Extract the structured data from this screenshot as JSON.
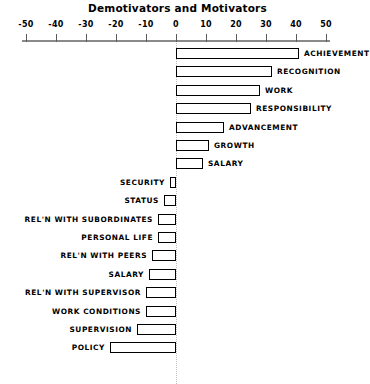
{
  "chart": {
    "title": "Demotivators and Motivators"
  },
  "axis": {
    "min": -50,
    "max": 50,
    "ticks": [
      -50,
      -40,
      -30,
      -20,
      -10,
      0,
      10,
      20,
      30,
      40,
      50
    ],
    "tick_labels": [
      "-50",
      "-40",
      "-30",
      "-20",
      "-10",
      "0",
      "10",
      "20",
      "30",
      "40",
      "50"
    ]
  },
  "chart_data": {
    "type": "bar",
    "orientation": "horizontal",
    "title": "Demotivators and Motivators",
    "xlabel": "",
    "ylabel": "",
    "xlim": [
      -50,
      50
    ],
    "grid": false,
    "legend": "none",
    "categories": [
      "ACHIEVEMENT",
      "RECOGNITION",
      "WORK",
      "RESPONSIBILITY",
      "ADVANCEMENT",
      "GROWTH",
      "SALARY",
      "SECURITY",
      "STATUS",
      "REL'N WITH SUBORDINATES",
      "PERSONAL LIFE",
      "REL'N WITH PEERS",
      "SALARY",
      "REL'N WITH SUPERVISOR",
      "WORK CONDITIONS",
      "SUPERVISION",
      "POLICY"
    ],
    "values": [
      41,
      32,
      28,
      25,
      16,
      11,
      9,
      -2,
      -4,
      -6,
      -6,
      -8,
      -9,
      -10,
      -10,
      -13,
      -22
    ]
  },
  "bars": [
    {
      "label": "ACHIEVEMENT",
      "value": 41,
      "side": "positive"
    },
    {
      "label": "RECOGNITION",
      "value": 32,
      "side": "positive"
    },
    {
      "label": "WORK",
      "value": 28,
      "side": "positive"
    },
    {
      "label": "RESPONSIBILITY",
      "value": 25,
      "side": "positive"
    },
    {
      "label": "ADVANCEMENT",
      "value": 16,
      "side": "positive"
    },
    {
      "label": "GROWTH",
      "value": 11,
      "side": "positive"
    },
    {
      "label": "SALARY",
      "value": 9,
      "side": "positive"
    },
    {
      "label": "SECURITY",
      "value": -2,
      "side": "negative"
    },
    {
      "label": "STATUS",
      "value": -4,
      "side": "negative"
    },
    {
      "label": "REL'N WITH SUBORDINATES",
      "value": -6,
      "side": "negative"
    },
    {
      "label": "PERSONAL LIFE",
      "value": -6,
      "side": "negative"
    },
    {
      "label": "REL'N WITH PEERS",
      "value": -8,
      "side": "negative"
    },
    {
      "label": "SALARY",
      "value": -9,
      "side": "negative"
    },
    {
      "label": "REL'N WITH SUPERVISOR",
      "value": -10,
      "side": "negative"
    },
    {
      "label": "WORK CONDITIONS",
      "value": -10,
      "side": "negative"
    },
    {
      "label": "SUPERVISION",
      "value": -13,
      "side": "negative"
    },
    {
      "label": "POLICY",
      "value": -22,
      "side": "negative"
    }
  ]
}
